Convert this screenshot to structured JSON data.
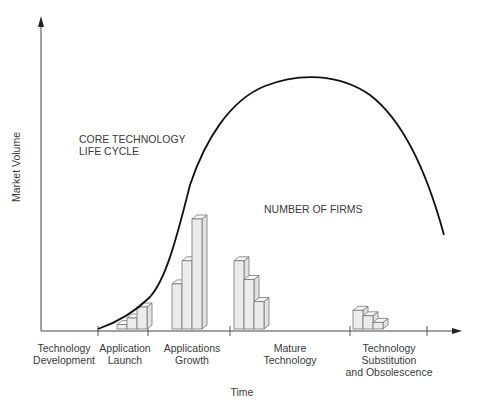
{
  "y_axis_label": "Market Volume",
  "x_axis_label": "Time",
  "curve_label": [
    "CORE TECHNOLOGY",
    "LIFE CYCLE"
  ],
  "bars_label": "NUMBER OF FIRMS",
  "phases": [
    {
      "lines": [
        "Technology",
        "Development"
      ]
    },
    {
      "lines": [
        "Application",
        "Launch"
      ]
    },
    {
      "lines": [
        "Applications",
        "Growth"
      ]
    },
    {
      "lines": [
        "Mature",
        "Technology"
      ]
    },
    {
      "lines": [
        "Technology",
        "Substitution",
        "and Obsolescence"
      ]
    }
  ],
  "firm_bars": [
    {
      "phase": "Application Launch",
      "relative_heights": [
        0.04,
        0.1,
        0.2
      ]
    },
    {
      "phase": "Applications Growth",
      "relative_heights": [
        0.41,
        0.62,
        1.0
      ]
    },
    {
      "phase": "Mature Technology",
      "relative_heights": [
        0.62,
        0.45,
        0.25
      ]
    },
    {
      "phase": "Technology Substitution and Obsolescence",
      "relative_heights": [
        0.17,
        0.12,
        0.06
      ]
    }
  ]
}
